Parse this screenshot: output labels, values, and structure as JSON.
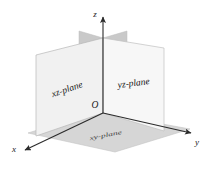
{
  "figure": {
    "background_color": "#ffffff",
    "axes": [
      {
        "key": "x",
        "label": "x",
        "direction": "down-left",
        "arrowhead": "solid-triangle"
      },
      {
        "key": "y",
        "label": "y",
        "direction": "right",
        "arrowhead": "solid-triangle"
      },
      {
        "key": "z",
        "label": "z",
        "direction": "up",
        "arrowhead": "solid-triangle"
      }
    ],
    "origin": {
      "label": "O"
    },
    "planes": [
      {
        "key": "xz",
        "label": "xz-plane",
        "fill": "#f2f2f2",
        "stroke": "#b9b9b9",
        "orientation": "vertical-left",
        "label_rotation_deg": -21
      },
      {
        "key": "yz",
        "label": "yz-plane",
        "fill": "#f7f7f7",
        "stroke": "#c2c2c2",
        "orientation": "vertical-right",
        "label_rotation_deg": -7
      },
      {
        "key": "xy",
        "label": "xy-plane",
        "fill": "#d6d6d6",
        "stroke": "#bdbdbd",
        "orientation": "horizontal-floor",
        "label_rotation_deg": -11
      }
    ],
    "tabs": [
      {
        "key": "xz-top-tab",
        "fill": "#c9c9c9"
      },
      {
        "key": "yz-top-tab",
        "fill": "#c9c9c9"
      }
    ],
    "axis_color": "#2b2b2b"
  }
}
